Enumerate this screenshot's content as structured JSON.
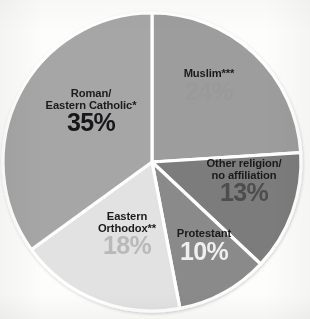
{
  "background_color": "#fdfdfc",
  "chart_data": {
    "type": "pie",
    "title": "",
    "subtitle": "",
    "xlabel": "",
    "ylabel": "",
    "legend_position": "none",
    "grid": false,
    "units": "percent",
    "total": 100,
    "start_angle_deg": 0,
    "direction": "clockwise",
    "categories": [
      "Muslim***",
      "Other religion/ no affiliation",
      "Protestant",
      "Eastern Orthodox**",
      "Roman/ Eastern Catholic*"
    ],
    "values": [
      24,
      13,
      10,
      18,
      35
    ],
    "slices": [
      {
        "key": "muslim",
        "name_line1": "Muslim***",
        "name_line2": "",
        "value": 24,
        "value_label": "24%",
        "fill": "#9d9d9d",
        "name_color": "#1b1b1b",
        "value_color": "#9a9a9a",
        "start_deg": 0,
        "end_deg": 86.4
      },
      {
        "key": "other-religion",
        "name_line1": "Other religion/",
        "name_line2": "no affiliation",
        "value": 13,
        "value_label": "13%",
        "fill": "#7b7b7b",
        "name_color": "#1b1b1b",
        "value_color": "#4d4d4d",
        "start_deg": 86.4,
        "end_deg": 133.2
      },
      {
        "key": "protestant",
        "name_line1": "Protestant",
        "name_line2": "",
        "value": 10,
        "value_label": "10%",
        "fill": "#8a8a8a",
        "name_color": "#1b1b1b",
        "value_color": "#efefef",
        "start_deg": 133.2,
        "end_deg": 169.2
      },
      {
        "key": "eastern-orthodox",
        "name_line1": "Eastern",
        "name_line2": "Orthodox**",
        "value": 18,
        "value_label": "18%",
        "fill": "#e2e2e2",
        "name_color": "#1b1b1b",
        "value_color": "#b9b9b9",
        "start_deg": 169.2,
        "end_deg": 234.0
      },
      {
        "key": "roman-catholic",
        "name_line1": "Roman/",
        "name_line2": "Eastern Catholic*",
        "value": 35,
        "value_label": "35%",
        "fill": "#a6a6a6",
        "name_color": "#1b1b1b",
        "value_color": "#17171a",
        "start_deg": 234.0,
        "end_deg": 360.0
      }
    ],
    "separator_color": "#ffffff",
    "geometry": {
      "center_x": 152,
      "center_y": 162,
      "radius": 149
    }
  }
}
